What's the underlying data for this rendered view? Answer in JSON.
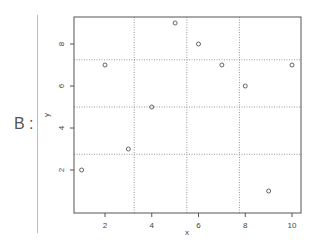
{
  "panel_label": "B :",
  "chart_data": {
    "type": "scatter",
    "title": "",
    "xlabel": "x",
    "ylabel": "y",
    "x": [
      1,
      2,
      3,
      4,
      5,
      6,
      7,
      8,
      9,
      10
    ],
    "y": [
      2,
      7,
      3,
      5,
      9,
      8,
      7,
      6,
      1,
      7
    ],
    "xlim": [
      0.6,
      10.4
    ],
    "ylim": [
      0.7,
      9.3
    ],
    "xticks": [
      2,
      4,
      6,
      8,
      10
    ],
    "yticks": [
      2,
      4,
      6,
      8
    ],
    "grid": {
      "on": true,
      "style": "dotted",
      "x_lines": [
        3.25,
        5.5,
        7.75
      ],
      "y_lines": [
        2.75,
        5,
        7.25
      ]
    },
    "marker": "open-circle",
    "legend": null
  },
  "colors": {
    "axis": "#555555",
    "grid": "#999999",
    "points": "#555555",
    "text": "#444444"
  }
}
